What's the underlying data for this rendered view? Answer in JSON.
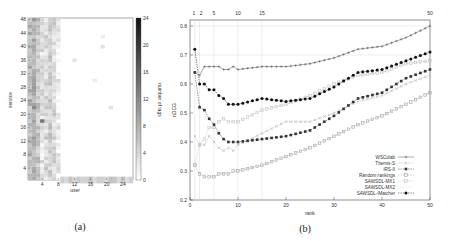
{
  "figure": {
    "captions": {
      "a": "(a)",
      "b": "(b)"
    }
  },
  "chart_data": [
    {
      "type": "heatmap",
      "panel": "(a)",
      "title": "",
      "xlabel": "user",
      "ylabel": "service",
      "colorbar_label": "number of tags",
      "x_ticks": [
        4,
        8,
        12,
        16,
        20,
        24
      ],
      "y_ticks": [
        4,
        8,
        12,
        16,
        20,
        24,
        28,
        32,
        36,
        40,
        44,
        48
      ],
      "colorbar_ticks": [
        0,
        4,
        8,
        12,
        16,
        20,
        24
      ],
      "colorbar_range": [
        0,
        24
      ],
      "colormap": "white-to-black (grayscale)",
      "description": "Dense tagging concentrated in users 1-8 across all services; sparse light cells elsewhere; row 1-2 (services) has moderate tags across most users.",
      "cells": [
        {
          "user": 1,
          "service_range": [
            1,
            48
          ],
          "approx_tags": 7
        },
        {
          "user": 2,
          "service_range": [
            1,
            48
          ],
          "approx_tags": 8
        },
        {
          "user": 3,
          "service_range": [
            1,
            48
          ],
          "approx_tags": 6
        },
        {
          "user": 4,
          "service_range": [
            1,
            48
          ],
          "approx_tags": 3
        },
        {
          "user": 5,
          "service_range": [
            1,
            48
          ],
          "approx_tags": 4
        },
        {
          "user": 6,
          "service_range": [
            1,
            48
          ],
          "approx_tags": 5
        },
        {
          "user": 7,
          "service_range": [
            1,
            48
          ],
          "approx_tags": 4
        },
        {
          "user": 8,
          "service_range": [
            1,
            48
          ],
          "approx_tags": 2
        },
        {
          "user": 4,
          "service": 18,
          "approx_tags": 14
        },
        {
          "user": 2,
          "service": 22,
          "approx_tags": 12
        },
        {
          "user": 19,
          "service": 40,
          "approx_tags": 3
        },
        {
          "user": 19,
          "service": 43,
          "approx_tags": 2
        },
        {
          "user": 12,
          "service": 36,
          "approx_tags": 3
        },
        {
          "user": 17,
          "service": 30,
          "approx_tags": 2
        },
        {
          "user": 21,
          "service": 22,
          "approx_tags": 3
        },
        {
          "user": "9-26",
          "service": 1,
          "approx_tags": 5
        }
      ]
    },
    {
      "type": "line",
      "panel": "(b)",
      "title": "",
      "xlabel": "rank",
      "ylabel": "nDCG",
      "xlim": [
        0,
        51
      ],
      "ylim": [
        0.2,
        0.82
      ],
      "x_ticks": [
        0,
        10,
        20,
        30,
        40,
        50
      ],
      "y_ticks": [
        0.2,
        0.3,
        0.4,
        0.5,
        0.6,
        0.7,
        0.8
      ],
      "top_x_ticks": [
        1,
        2,
        5,
        10,
        15,
        50
      ],
      "grid": "vertical lines at top ticks; horizontal at 0.7 and 0.8",
      "legend_position": "lower right",
      "legend": [
        "WSColab",
        "Themis-S",
        "iRS-II",
        "Random rankings",
        "SAWSDL-MX1",
        "SAWSDL-MX2",
        "SAWSDL-iMatcher"
      ],
      "x": [
        1,
        2,
        3,
        4,
        5,
        6,
        7,
        8,
        9,
        10,
        15,
        20,
        25,
        30,
        35,
        40,
        45,
        50
      ],
      "series": [
        {
          "name": "WSColab",
          "marker": "+",
          "values": [
            0.64,
            0.63,
            0.66,
            0.66,
            0.66,
            0.66,
            0.65,
            0.65,
            0.66,
            0.65,
            0.66,
            0.66,
            0.67,
            0.69,
            0.72,
            0.73,
            0.76,
            0.8
          ]
        },
        {
          "name": "Themis-S",
          "marker": "x",
          "values": [
            0.42,
            0.39,
            0.39,
            0.42,
            0.4,
            0.38,
            0.37,
            0.38,
            0.37,
            0.39,
            0.43,
            0.47,
            0.47,
            0.5,
            0.54,
            0.56,
            0.6,
            0.63
          ]
        },
        {
          "name": "iRS-II",
          "marker": "filled-square",
          "values": [
            0.64,
            0.52,
            0.51,
            0.48,
            0.46,
            0.43,
            0.41,
            0.4,
            0.4,
            0.4,
            0.41,
            0.42,
            0.44,
            0.49,
            0.55,
            0.57,
            0.62,
            0.65
          ]
        },
        {
          "name": "Random rankings",
          "marker": "open-square",
          "values": [
            0.32,
            0.29,
            0.28,
            0.28,
            0.28,
            0.29,
            0.29,
            0.29,
            0.3,
            0.3,
            0.32,
            0.35,
            0.38,
            0.42,
            0.46,
            0.49,
            0.53,
            0.57
          ]
        },
        {
          "name": "SAWSDL-MX1",
          "marker": "open-square-light",
          "values": [
            0.32,
            0.39,
            0.41,
            0.45,
            0.45,
            0.47,
            0.48,
            0.47,
            0.47,
            0.47,
            0.51,
            0.53,
            0.56,
            0.6,
            0.63,
            0.64,
            0.67,
            0.68
          ]
        },
        {
          "name": "SAWSDL-MX2",
          "marker": "none",
          "values": [
            0.72,
            0.62,
            0.6,
            0.58,
            0.58,
            0.56,
            0.55,
            0.53,
            0.53,
            0.53,
            0.55,
            0.54,
            0.55,
            0.59,
            0.63,
            0.64,
            0.67,
            0.68
          ]
        },
        {
          "name": "SAWSDL-iMatcher",
          "marker": "filled-circle",
          "values": [
            0.72,
            0.6,
            0.6,
            0.58,
            0.58,
            0.56,
            0.55,
            0.53,
            0.53,
            0.53,
            0.55,
            0.54,
            0.55,
            0.59,
            0.64,
            0.65,
            0.68,
            0.71
          ]
        }
      ]
    }
  ]
}
